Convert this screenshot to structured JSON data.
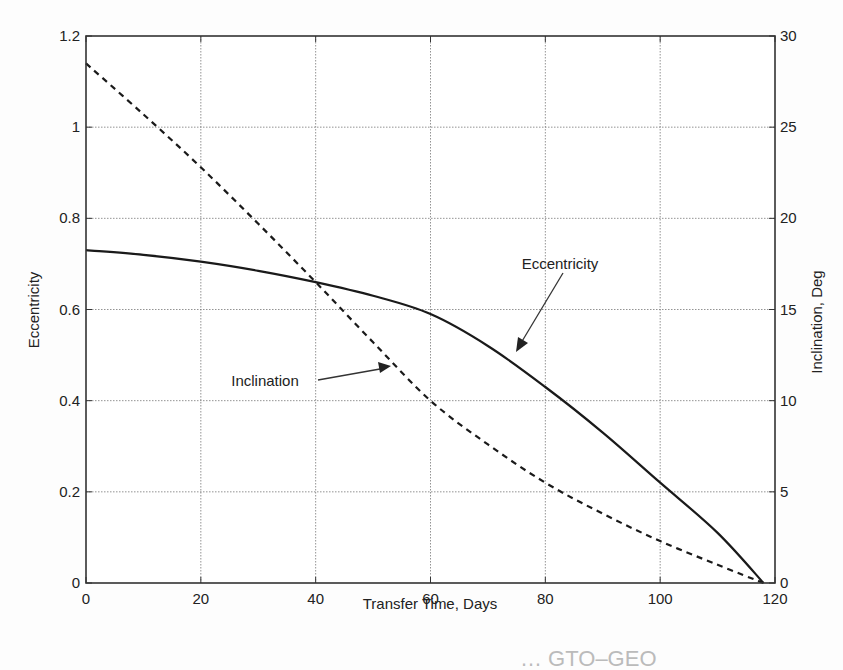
{
  "chart_data": {
    "type": "line",
    "title": "",
    "xlabel": "Transfer Time, Days",
    "ylabel": "Eccentricity",
    "y2label": "Inclination, Deg",
    "xlim": [
      0,
      120
    ],
    "ylim": [
      0,
      1.2
    ],
    "y2lim": [
      0,
      30
    ],
    "xticks": [
      0,
      20,
      40,
      60,
      80,
      100,
      120
    ],
    "yticks": [
      0,
      0.2,
      0.4,
      0.6,
      0.8,
      1,
      1.2
    ],
    "y2ticks": [
      0,
      5,
      10,
      15,
      20,
      25,
      30
    ],
    "xtick_labels": [
      "0",
      "20",
      "40",
      "60",
      "80",
      "100",
      "120"
    ],
    "ytick_labels": [
      "0",
      "0.2",
      "0.4",
      "0.6",
      "0.8",
      "1",
      "1.2"
    ],
    "y2tick_labels": [
      "0",
      "5",
      "10",
      "15",
      "20",
      "25",
      "30"
    ],
    "grid": true,
    "legend": null,
    "series": [
      {
        "name": "Eccentricity",
        "axis": "left",
        "style": "solid",
        "x": [
          0,
          10,
          20,
          30,
          40,
          50,
          60,
          70,
          80,
          90,
          100,
          110,
          118
        ],
        "values": [
          0.73,
          0.72,
          0.705,
          0.685,
          0.66,
          0.63,
          0.59,
          0.52,
          0.43,
          0.33,
          0.22,
          0.11,
          0.0
        ]
      },
      {
        "name": "Inclination",
        "axis": "right",
        "style": "dashed",
        "x": [
          0,
          10,
          20,
          30,
          40,
          50,
          60,
          70,
          80,
          90,
          100,
          110,
          118
        ],
        "values": [
          28.5,
          25.7,
          22.8,
          19.7,
          16.5,
          13.2,
          10.0,
          7.6,
          5.5,
          3.8,
          2.3,
          1.0,
          0.0
        ]
      }
    ],
    "annotations": [
      {
        "text": "Eccentricity",
        "arrow_to": "Eccentricity curve near 75 days"
      },
      {
        "text": "Inclination",
        "arrow_to": "Inclination curve near 53 days"
      }
    ]
  },
  "caption_fragment": "… GTO–GEO"
}
